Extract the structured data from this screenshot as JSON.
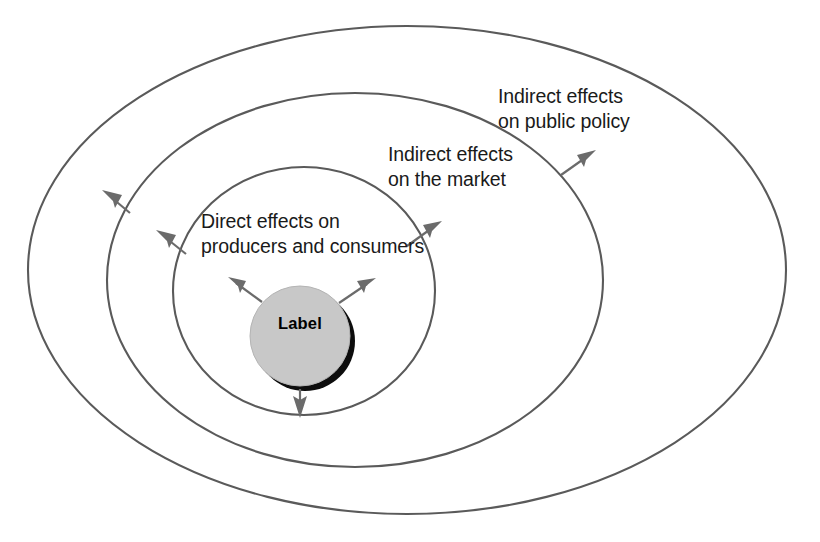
{
  "diagram": {
    "type": "concentric-ellipse-influence-diagram",
    "background_color": "#ffffff",
    "core": {
      "name": "core-node",
      "text": "Label",
      "fill_color": "#c8c8c8",
      "shadow_color": "#0d0d0d",
      "shape": "circle",
      "center": {
        "x": 300,
        "y": 336
      },
      "radius": 50
    },
    "rings": [
      {
        "id": "inner",
        "label": "Direct effects on\nproducers and consumers",
        "label_line1": "Direct effects on",
        "label_line2": "producers and consumers",
        "stroke_color": "#5a5a5a",
        "center": {
          "x": 304,
          "y": 291
        },
        "rx": 131,
        "ry": 124
      },
      {
        "id": "middle",
        "label": "Indirect effects\non the market",
        "label_line1": "Indirect effects",
        "label_line2": "on the market",
        "stroke_color": "#5a5a5a",
        "center": {
          "x": 355,
          "y": 280
        },
        "rx": 248,
        "ry": 187
      },
      {
        "id": "outer",
        "label": "Indirect effects\non public policy",
        "label_line1": "Indirect effects",
        "label_line2": "on public policy",
        "stroke_color": "#5a5a5a",
        "center": {
          "x": 407,
          "y": 270
        },
        "rx": 379,
        "ry": 244
      }
    ],
    "arrows": [
      {
        "id": "arrow-core-upleft",
        "from": "core",
        "to": "inner",
        "direction": "up-left",
        "color": "#6b6b6b"
      },
      {
        "id": "arrow-core-upright",
        "from": "core",
        "to": "inner",
        "direction": "up-right",
        "color": "#6b6b6b"
      },
      {
        "id": "arrow-core-down",
        "from": "core",
        "to": "inner",
        "direction": "down",
        "color": "#6b6b6b"
      },
      {
        "id": "arrow-inner-upleft",
        "from": "inner",
        "to": "middle",
        "direction": "up-left",
        "color": "#6b6b6b"
      },
      {
        "id": "arrow-inner-upright",
        "from": "inner",
        "to": "middle",
        "direction": "up-right",
        "color": "#6b6b6b"
      },
      {
        "id": "arrow-middle-upleft",
        "from": "middle",
        "to": "outer",
        "direction": "up-left",
        "color": "#6b6b6b"
      },
      {
        "id": "arrow-middle-upright",
        "from": "middle",
        "to": "outer",
        "direction": "up-right",
        "color": "#6b6b6b"
      }
    ]
  }
}
